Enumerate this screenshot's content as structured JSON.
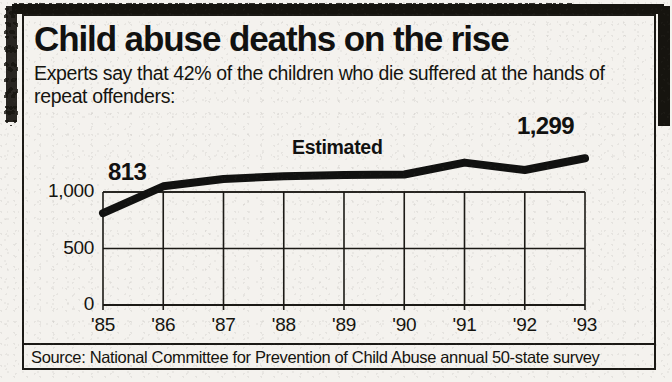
{
  "headline": "Child abuse deaths on the rise",
  "deck": "Experts say that 42% of the children who die suffered at the hands of repeat offenders:",
  "source": "Source: National Committee for Prevention of Child Abuse annual 50-state survey",
  "annotations": {
    "first_value_label": "813",
    "last_value_label": "1,299",
    "estimated_label": "Estimated"
  },
  "colors": {
    "ink": "#111110",
    "paper": "#f4f2ee",
    "rule": "#1b1915",
    "line": "#111110"
  },
  "chart_data": {
    "type": "line",
    "title": "Child abuse deaths on the rise",
    "xlabel": "",
    "ylabel": "",
    "ylim": [
      0,
      1500
    ],
    "yticks": [
      0,
      500,
      1000
    ],
    "ytick_labels": [
      "0",
      "500",
      "1,000"
    ],
    "grid": true,
    "legend": false,
    "categories": [
      "'85",
      "'86",
      "'87",
      "'88",
      "'89",
      "'90",
      "'91",
      "'92",
      "'93"
    ],
    "x": [
      "'85",
      "'86",
      "'87",
      "'88",
      "'89",
      "'90",
      "'91",
      "'92",
      "'93"
    ],
    "values": [
      813,
      1050,
      1115,
      1140,
      1150,
      1155,
      1260,
      1195,
      1299
    ],
    "point_labels": {
      "'85": "813",
      "'93": "1,299"
    },
    "annotations": [
      {
        "text": "Estimated",
        "near": "'89"
      }
    ]
  }
}
